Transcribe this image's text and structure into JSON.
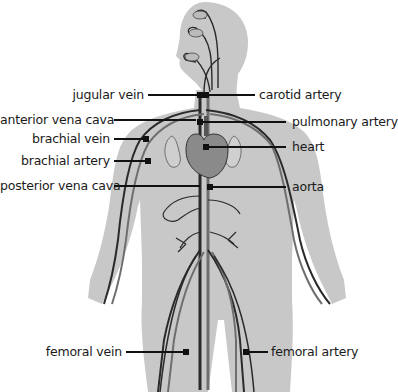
{
  "diagram": {
    "colors": {
      "body_silhouette": "#c8c8c8",
      "vessel_dark": "#2a2a2a",
      "vessel_mid": "#6e6e6e",
      "heart": "#8a8a8a",
      "leader_line": "#111111",
      "text": "#1a1a1a",
      "background": "#ffffff"
    },
    "labels": {
      "jugular_vein": "jugular vein",
      "carotid_artery": "carotid artery",
      "anterior_vena_cava": "anterior vena cava",
      "pulmonary_artery": "pulmonary artery",
      "brachial_vein": "brachial vein",
      "heart": "heart",
      "brachial_artery": "brachial artery",
      "posterior_vena_cava": "posterior vena cava",
      "aorta": "aorta",
      "femoral_vein": "femoral vein",
      "femoral_artery": "femoral artery"
    }
  }
}
